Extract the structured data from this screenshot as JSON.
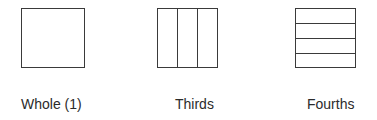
{
  "diagram": {
    "shapes": [
      {
        "id": "whole",
        "label": "Whole (1)",
        "divisions": 1,
        "orientation": "none"
      },
      {
        "id": "thirds",
        "label": "Thirds",
        "divisions": 3,
        "orientation": "vertical"
      },
      {
        "id": "fourths",
        "label": "Fourths",
        "divisions": 4,
        "orientation": "horizontal"
      }
    ],
    "colors": {
      "stroke": "#3a3a3a",
      "text": "#2b2b2b",
      "background": "#ffffff"
    }
  }
}
